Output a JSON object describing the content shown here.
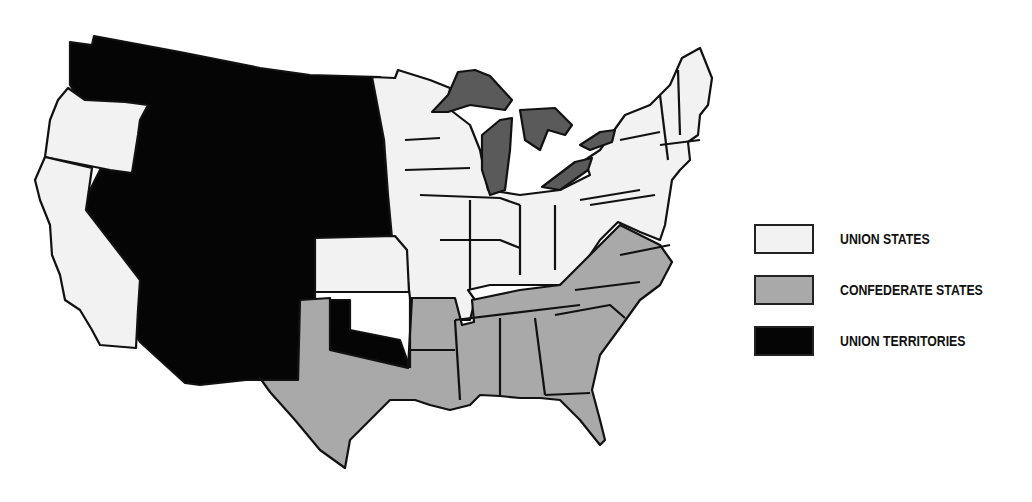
{
  "map": {
    "title": "",
    "colors": {
      "union_states": "#f2f2f2",
      "confederate_states": "#a9a9a9",
      "union_territories": "#050505",
      "great_lakes": "#5a5a5a",
      "border": "#111111"
    }
  },
  "legend": {
    "items": [
      {
        "label": "UNION STATES",
        "color": "#f2f2f2"
      },
      {
        "label": "CONFEDERATE STATES",
        "color": "#a9a9a9"
      },
      {
        "label": "UNION TERRITORIES",
        "color": "#050505"
      }
    ]
  }
}
